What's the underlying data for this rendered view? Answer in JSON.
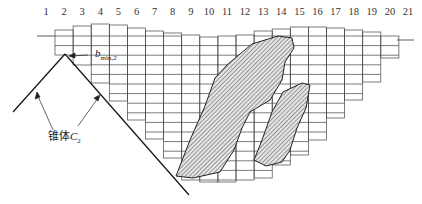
{
  "figure": {
    "type": "open-pit block model cross-section",
    "column_labels": [
      "1",
      "2",
      "3",
      "4",
      "5",
      "6",
      "7",
      "8",
      "9",
      "10",
      "11",
      "12",
      "13",
      "14",
      "15",
      "16",
      "17",
      "18",
      "19",
      "20",
      "21"
    ],
    "annotations": {
      "bmin_symbol": "b",
      "bmin_subscript": "min,2",
      "cone_label_text": "锥体",
      "cone_label_symbol": "C",
      "cone_label_subscript": "2"
    },
    "ore_bodies": [
      {
        "name": "ore-body-1",
        "pattern": "diagonal-hatch"
      },
      {
        "name": "ore-body-2",
        "pattern": "diagonal-hatch"
      }
    ],
    "colors": {
      "line": "#333333",
      "grid": "#444444",
      "hatch": "#555555",
      "background": "#ffffff"
    }
  }
}
